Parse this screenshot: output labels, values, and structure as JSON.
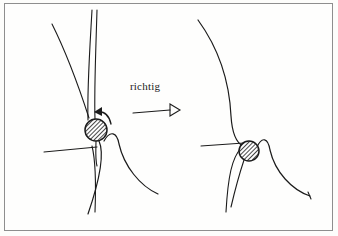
{
  "figure": {
    "title": "richtig",
    "kind": "anatomical-line-drawing",
    "background_color": "#fdfdfb",
    "frame_color": "#8e8e8e",
    "ink_color": "#1b1b1b"
  },
  "annotation": {
    "label": "richtig",
    "label_x": 130,
    "label_y": 80,
    "arrow": {
      "name": "straight-arrow-right",
      "x1": 133,
      "y1": 113,
      "x2": 174,
      "y2": 110,
      "head": "open-triangle"
    }
  },
  "panels": [
    {
      "name": "left-panel",
      "side": "left",
      "patella": {
        "cx": 96,
        "cy": 130,
        "rx": 11,
        "ry": 11,
        "fill": "hatch-diagonal",
        "label": "patella"
      },
      "rotation_arrow": {
        "name": "curved-rotation-arrow",
        "direction": "counterclockwise",
        "path": "M 110 122 Q 106 110 95 112",
        "head_points": "95,112 102,108 101,116"
      },
      "strokes": [
        {
          "name": "femur-lateral-curve",
          "d": "M 52 24 C 62 44 76 78 89 118"
        },
        {
          "name": "femur-axis-line-outer",
          "d": "M 92 10 C 90 46 87 88 88 120"
        },
        {
          "name": "femur-axis-line-inner",
          "d": "M 97 10 C 96 46 94 90 95 119"
        },
        {
          "name": "patellar-tendon-upper",
          "d": "M 96 140 C 96 150 95 158 97 166"
        },
        {
          "name": "tibial-plateau-line",
          "d": "M 44 152 L 97 147"
        },
        {
          "name": "tibia-anterior-curve",
          "d": "M 99 141 C 104 152 101 176 88 214"
        },
        {
          "name": "tibia-posterior-curve",
          "d": "M 92 146 C 96 162 96 186 95 212"
        },
        {
          "name": "tibial-tubercle-bump",
          "d": "M 104 141 C 110 130 117 132 119 144 C 124 166 140 186 158 194"
        }
      ]
    },
    {
      "name": "right-panel",
      "side": "right",
      "patella": {
        "cx": 249,
        "cy": 151,
        "rx": 10,
        "ry": 10,
        "fill": "hatch-diagonal",
        "label": "patella"
      },
      "rotation_arrow": null,
      "strokes": [
        {
          "name": "femur-anterior-curve",
          "d": "M 198 20 C 214 42 229 74 231 116 C 232 132 235 142 243 146"
        },
        {
          "name": "tibial-plateau-line",
          "d": "M 201 146 L 244 143"
        },
        {
          "name": "patellar-tendon",
          "d": "M 241 148 C 232 158 228 176 226 212"
        },
        {
          "name": "tibia-shaft",
          "d": "M 243 159 C 239 172 234 190 230 208"
        },
        {
          "name": "tibial-tubercle-bump",
          "d": "M 257 147 C 262 136 268 138 270 150 C 275 172 292 190 310 196"
        },
        {
          "name": "end-tick-mark",
          "d": "M 308 192 L 311 199"
        }
      ]
    }
  ]
}
